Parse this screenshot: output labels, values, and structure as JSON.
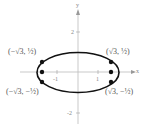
{
  "diagram": {
    "type": "ellipse-graph",
    "equation": "x^2/4 + y^2 = 1",
    "axes": {
      "x_label": "x",
      "y_label": "y"
    },
    "ticks": {
      "x_neg": "-1",
      "x_pos": "1",
      "y_pos": "2",
      "y_neg": "-2"
    },
    "points": [
      {
        "label": "(−√3, ½)"
      },
      {
        "label": "(√3, ½)"
      },
      {
        "label": "(−√3, −½)"
      },
      {
        "label": "(√3, −½)"
      }
    ],
    "colors": {
      "curve": "#111111",
      "axis": "#bbbbbb",
      "text": "#555555"
    }
  }
}
